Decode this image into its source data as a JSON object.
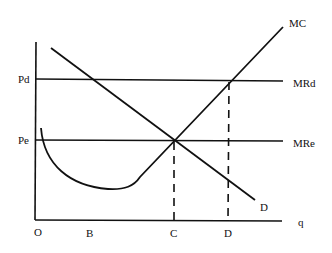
{
  "diagram": {
    "type": "economics-price-discrimination",
    "axes": {
      "origin_label": "O",
      "x_axis_label": "q"
    },
    "price_labels": {
      "pd": "Pd",
      "pe": "Pe"
    },
    "curve_labels": {
      "mc": "MC",
      "mrd": "MRd",
      "mre": "MRe",
      "demand": "D"
    },
    "quantity_labels": {
      "b": "B",
      "c": "C",
      "d": "D"
    },
    "colors": {
      "line": "#111111",
      "background": "#ffffff"
    }
  }
}
